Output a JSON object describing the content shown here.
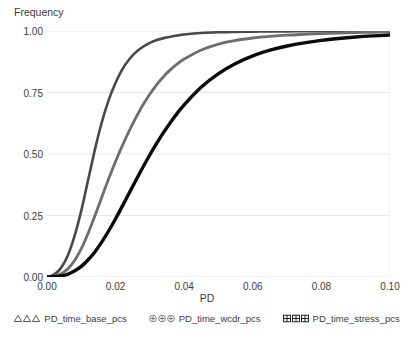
{
  "chart_data": {
    "type": "line",
    "title": "",
    "xlabel": "PD",
    "ylabel": "Frequency",
    "xlim": [
      0.0,
      0.1
    ],
    "ylim": [
      0.0,
      1.0
    ],
    "xticks": [
      "0.00",
      "0.02",
      "0.04",
      "0.06",
      "0.08",
      "0.10"
    ],
    "xtick_values": [
      0.0,
      0.02,
      0.04,
      0.06,
      0.08,
      0.1
    ],
    "yticks": [
      "0.00",
      "0.25",
      "0.50",
      "0.75",
      "1.00"
    ],
    "ytick_values": [
      0.0,
      0.25,
      0.5,
      0.75,
      1.0
    ],
    "grid": "horizontal-light",
    "legend_position": "bottom",
    "x": [
      0.0,
      0.002,
      0.004,
      0.006,
      0.008,
      0.01,
      0.012,
      0.014,
      0.016,
      0.018,
      0.02,
      0.022,
      0.024,
      0.026,
      0.028,
      0.03,
      0.032,
      0.034,
      0.036,
      0.038,
      0.04,
      0.045,
      0.05,
      0.055,
      0.06,
      0.065,
      0.07,
      0.075,
      0.08,
      0.085,
      0.09,
      0.095,
      0.1
    ],
    "series": [
      {
        "name": "PD_time_base_pcs",
        "color": "#484848",
        "width": 2.6,
        "marker": "triangle",
        "values": [
          0.0,
          0.01,
          0.035,
          0.085,
          0.165,
          0.27,
          0.395,
          0.52,
          0.63,
          0.72,
          0.79,
          0.845,
          0.885,
          0.915,
          0.936,
          0.952,
          0.963,
          0.971,
          0.977,
          0.982,
          0.986,
          0.992,
          0.995,
          0.9965,
          0.9975,
          0.998,
          0.9985,
          0.999,
          0.9992,
          0.9994,
          0.9996,
          0.9998,
          1.0
        ]
      },
      {
        "name": "PD_time_wcdr_pcs",
        "color": "#6e6e6e",
        "width": 2.8,
        "marker": "circle-plus",
        "values": [
          0.0,
          0.003,
          0.012,
          0.032,
          0.066,
          0.115,
          0.178,
          0.25,
          0.325,
          0.4,
          0.47,
          0.535,
          0.595,
          0.65,
          0.7,
          0.744,
          0.782,
          0.815,
          0.843,
          0.866,
          0.886,
          0.923,
          0.947,
          0.962,
          0.9715,
          0.978,
          0.983,
          0.9865,
          0.9895,
          0.9915,
          0.9935,
          0.995,
          0.9965
        ]
      },
      {
        "name": "PD_time_stress_pcs",
        "color": "#0a0a0a",
        "width": 3.4,
        "marker": "grid-square",
        "values": [
          0.0,
          0.001,
          0.004,
          0.011,
          0.024,
          0.043,
          0.07,
          0.103,
          0.143,
          0.188,
          0.237,
          0.289,
          0.342,
          0.395,
          0.447,
          0.497,
          0.544,
          0.588,
          0.628,
          0.666,
          0.7,
          0.772,
          0.827,
          0.868,
          0.899,
          0.922,
          0.939,
          0.952,
          0.962,
          0.9695,
          0.9755,
          0.98,
          0.9835
        ]
      }
    ]
  },
  "legend": {
    "items": [
      {
        "label": "PD_time_base_pcs",
        "marker": "triangle"
      },
      {
        "label": "PD_time_wcdr_pcs",
        "marker": "circle-plus"
      },
      {
        "label": "PD_time_stress_pcs",
        "marker": "grid-square"
      }
    ]
  },
  "colors": {
    "background": "#ffffff",
    "text": "#3c3c3c",
    "gridline": "#e8e8e8",
    "axis": "#d9d9d9"
  }
}
